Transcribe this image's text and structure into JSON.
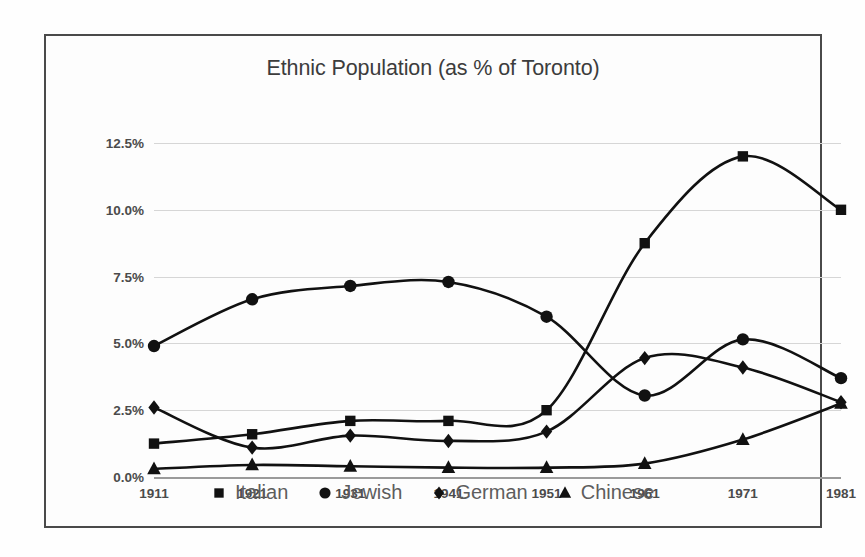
{
  "chart_data": {
    "type": "line",
    "title": "Ethnic Population (as % of Toronto)",
    "xlabel": "",
    "ylabel": "",
    "categories": [
      "1911",
      "1921",
      "1931",
      "1941",
      "1951",
      "1961",
      "1971",
      "1981"
    ],
    "x": [
      1911,
      1921,
      1931,
      1941,
      1951,
      1961,
      1971,
      1981
    ],
    "ylim": [
      0.0,
      12.5
    ],
    "yticks": [
      0.0,
      2.5,
      5.0,
      7.5,
      10.0,
      12.5
    ],
    "ytick_labels": [
      "0.0%",
      "2.5%",
      "5.0%",
      "7.5%",
      "10.0%",
      "12.5%"
    ],
    "grid": true,
    "legend_position": "bottom",
    "smoothing": "spline",
    "series": [
      {
        "name": "Italian",
        "marker": "square",
        "color": "#111111",
        "values": [
          1.25,
          1.6,
          2.1,
          2.1,
          2.5,
          8.75,
          12.0,
          10.0
        ]
      },
      {
        "name": "Jewish",
        "marker": "circle",
        "color": "#111111",
        "values": [
          4.9,
          6.65,
          7.15,
          7.3,
          6.0,
          3.05,
          5.15,
          3.7
        ]
      },
      {
        "name": "German",
        "marker": "diamond",
        "color": "#111111",
        "values": [
          2.6,
          1.1,
          1.55,
          1.35,
          1.7,
          4.45,
          4.1,
          2.8
        ]
      },
      {
        "name": "Chinese",
        "marker": "triangle",
        "color": "#111111",
        "values": [
          0.3,
          0.45,
          0.4,
          0.35,
          0.35,
          0.5,
          1.4,
          2.75
        ]
      }
    ]
  },
  "style": {
    "frame_border_color": "#4a4a4a",
    "grid_color": "#d6d6d6",
    "axis_color": "#9a9a9a",
    "tick_label_color": "#4b4b4b",
    "title_color": "#3c3c3c",
    "legend_label_color": "#5d5d5d",
    "background": "#fdfdfd"
  }
}
